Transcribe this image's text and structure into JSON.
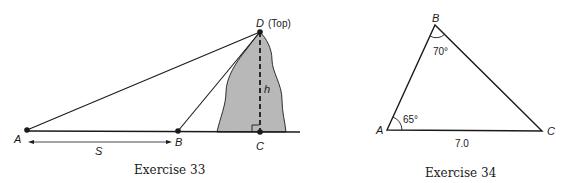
{
  "figures": [
    {
      "caption": "Exercise 33",
      "points": {
        "A": {
          "label": "A"
        },
        "B": {
          "label": "B"
        },
        "C": {
          "label": "C"
        },
        "D": {
          "label": "D",
          "annotation": "(Top)"
        }
      },
      "labels": {
        "distance": "S",
        "height": "h"
      }
    },
    {
      "caption": "Exercise 34",
      "points": {
        "A": {
          "label": "A"
        },
        "B": {
          "label": "B"
        },
        "C": {
          "label": "C"
        }
      },
      "angles": {
        "A": "65°",
        "B": "70°"
      },
      "side_AC": "7.0"
    }
  ],
  "colors": {
    "line": "#1a1a1a",
    "mountain_fill": "#b8b8b8"
  }
}
